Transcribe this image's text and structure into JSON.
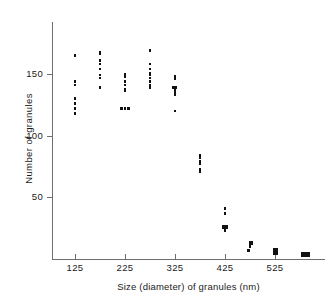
{
  "chart_data": {
    "type": "scatter",
    "title": "",
    "xlabel": "Size (diameter) of  granules  (nm)",
    "ylabel": "Number  of  granules",
    "xlim": [
      75,
      625
    ],
    "ylim": [
      0,
      190
    ],
    "grid": false,
    "legend": null,
    "xticks": [
      125,
      225,
      325,
      425,
      525
    ],
    "xticklabels": [
      "125",
      "225",
      "325",
      "425",
      "525"
    ],
    "yticks": [
      50,
      100,
      150
    ],
    "yticklabels": [
      "50",
      "100",
      "150"
    ],
    "marker": "square-dot",
    "marker_color": "#111111",
    "axis_color": "#6e6e6e",
    "points": [
      {
        "x": 125,
        "y": 165
      },
      {
        "x": 125,
        "y": 144
      },
      {
        "x": 125,
        "y": 141
      },
      {
        "x": 125,
        "y": 130
      },
      {
        "x": 125,
        "y": 126
      },
      {
        "x": 125,
        "y": 122
      },
      {
        "x": 125,
        "y": 118
      },
      {
        "x": 175,
        "y": 168
      },
      {
        "x": 175,
        "y": 166
      },
      {
        "x": 175,
        "y": 161
      },
      {
        "x": 175,
        "y": 158
      },
      {
        "x": 175,
        "y": 154
      },
      {
        "x": 175,
        "y": 149
      },
      {
        "x": 175,
        "y": 147
      },
      {
        "x": 175,
        "y": 139
      },
      {
        "x": 225,
        "y": 150
      },
      {
        "x": 225,
        "y": 148
      },
      {
        "x": 225,
        "y": 144
      },
      {
        "x": 225,
        "y": 141
      },
      {
        "x": 225,
        "y": 138
      },
      {
        "x": 225,
        "y": 136
      },
      {
        "x": 218,
        "y": 122
      },
      {
        "x": 225,
        "y": 122
      },
      {
        "x": 232,
        "y": 122
      },
      {
        "x": 275,
        "y": 169
      },
      {
        "x": 275,
        "y": 158
      },
      {
        "x": 275,
        "y": 154
      },
      {
        "x": 275,
        "y": 151
      },
      {
        "x": 275,
        "y": 149
      },
      {
        "x": 275,
        "y": 147
      },
      {
        "x": 275,
        "y": 144
      },
      {
        "x": 275,
        "y": 141
      },
      {
        "x": 275,
        "y": 139
      },
      {
        "x": 325,
        "y": 148
      },
      {
        "x": 325,
        "y": 146
      },
      {
        "x": 322,
        "y": 139
      },
      {
        "x": 327,
        "y": 139
      },
      {
        "x": 325,
        "y": 137
      },
      {
        "x": 325,
        "y": 135
      },
      {
        "x": 325,
        "y": 133
      },
      {
        "x": 325,
        "y": 120
      },
      {
        "x": 375,
        "y": 84
      },
      {
        "x": 375,
        "y": 82
      },
      {
        "x": 375,
        "y": 79
      },
      {
        "x": 375,
        "y": 77
      },
      {
        "x": 375,
        "y": 73
      },
      {
        "x": 375,
        "y": 71
      },
      {
        "x": 425,
        "y": 41
      },
      {
        "x": 425,
        "y": 37
      },
      {
        "x": 422,
        "y": 27
      },
      {
        "x": 428,
        "y": 27
      },
      {
        "x": 422,
        "y": 25
      },
      {
        "x": 428,
        "y": 25
      },
      {
        "x": 425,
        "y": 23
      },
      {
        "x": 475,
        "y": 14
      },
      {
        "x": 478,
        "y": 14
      },
      {
        "x": 475,
        "y": 12
      },
      {
        "x": 478,
        "y": 12
      },
      {
        "x": 475,
        "y": 10
      },
      {
        "x": 472,
        "y": 7
      },
      {
        "x": 523,
        "y": 8
      },
      {
        "x": 528,
        "y": 8
      },
      {
        "x": 523,
        "y": 6
      },
      {
        "x": 528,
        "y": 6
      },
      {
        "x": 523,
        "y": 4
      },
      {
        "x": 528,
        "y": 4
      },
      {
        "x": 580,
        "y": 5
      },
      {
        "x": 586,
        "y": 5
      },
      {
        "x": 592,
        "y": 5
      },
      {
        "x": 580,
        "y": 3
      },
      {
        "x": 586,
        "y": 3
      },
      {
        "x": 592,
        "y": 3
      }
    ]
  }
}
